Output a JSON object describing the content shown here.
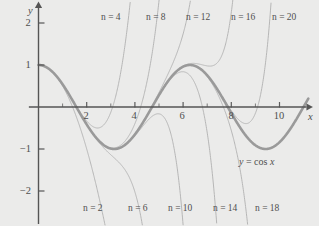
{
  "figure": {
    "caption": "Taylor polynomials of cos x at 0",
    "background_color": "#ebebea",
    "axis_color": "#555555",
    "cos_curve_color": "#9a9a9a",
    "taylor_curve_color": "#b3b3b3"
  },
  "axes": {
    "x_axis_name": "x",
    "y_axis_name": "y",
    "x_ticks_labeled": [
      "2",
      "4",
      "6",
      "8",
      "10"
    ],
    "y_ticks_labeled": [
      "2",
      "1",
      "−1",
      "−2"
    ]
  },
  "curve_label": {
    "text": "y = cos x",
    "lhs": "y",
    "eq": "=",
    "rhs": "cos x"
  },
  "series_labels_top": [
    {
      "text": "n = 4"
    },
    {
      "text": "n = 8"
    },
    {
      "text": "n = 12"
    },
    {
      "text": "n = 16"
    },
    {
      "text": "n = 20"
    }
  ],
  "series_labels_bottom": [
    {
      "text": "n = 2"
    },
    {
      "text": "n = 6"
    },
    {
      "text": "n = 10"
    },
    {
      "text": "n = 14"
    },
    {
      "text": "n = 18"
    }
  ],
  "chart_data": {
    "type": "line",
    "xlabel": "x",
    "ylabel": "y",
    "xlim": [
      -0.4,
      11.2
    ],
    "ylim": [
      -2.5,
      2.5
    ],
    "x_ticks": [
      1,
      2,
      3,
      4,
      5,
      6,
      7,
      8,
      9,
      10
    ],
    "x_tick_labels": [
      "",
      "2",
      "",
      "4",
      "",
      "6",
      "",
      "8",
      "",
      "10"
    ],
    "y_ticks": [
      -2,
      -1,
      1,
      2
    ],
    "y_tick_labels": [
      "−2",
      "−1",
      "1",
      "2"
    ],
    "grid": false,
    "legend": "inline-annotations",
    "series": [
      {
        "name": "y = cos x",
        "degree": null,
        "color": "#9a9a9a",
        "width": 2.6,
        "formula": "cos(x)",
        "annotation": {
          "text": "y = cos x",
          "x": 9.6,
          "y": -1.28
        }
      },
      {
        "name": "n = 2",
        "degree": 2,
        "color": "#b3b3b3",
        "width": 1,
        "formula": "1 - x^2/2!",
        "annotation_position": "bottom"
      },
      {
        "name": "n = 4",
        "degree": 4,
        "color": "#b3b3b3",
        "width": 1,
        "formula": "1 - x^2/2! + x^4/4!",
        "annotation_position": "top"
      },
      {
        "name": "n = 6",
        "degree": 6,
        "color": "#b3b3b3",
        "width": 1,
        "formula": "1 - x^2/2! + x^4/4! - x^6/6!",
        "annotation_position": "bottom"
      },
      {
        "name": "n = 8",
        "degree": 8,
        "color": "#b3b3b3",
        "width": 1,
        "formula": "sum_{k=0}^{4} (-1)^k x^{2k}/(2k)!",
        "annotation_position": "top"
      },
      {
        "name": "n = 10",
        "degree": 10,
        "color": "#b3b3b3",
        "width": 1,
        "formula": "sum_{k=0}^{5} (-1)^k x^{2k}/(2k)!",
        "annotation_position": "bottom"
      },
      {
        "name": "n = 12",
        "degree": 12,
        "color": "#b3b3b3",
        "width": 1,
        "formula": "sum_{k=0}^{6} (-1)^k x^{2k}/(2k)!",
        "annotation_position": "top"
      },
      {
        "name": "n = 14",
        "degree": 14,
        "color": "#b3b3b3",
        "width": 1,
        "formula": "sum_{k=0}^{7} (-1)^k x^{2k}/(2k)!",
        "annotation_position": "bottom"
      },
      {
        "name": "n = 16",
        "degree": 16,
        "color": "#b3b3b3",
        "width": 1,
        "formula": "sum_{k=0}^{8} (-1)^k x^{2k}/(2k)!",
        "annotation_position": "top"
      },
      {
        "name": "n = 18",
        "degree": 18,
        "color": "#b3b3b3",
        "width": 1,
        "formula": "sum_{k=0}^{9} (-1)^k x^{2k}/(2k)!",
        "annotation_position": "bottom"
      },
      {
        "name": "n = 20",
        "degree": 20,
        "color": "#b3b3b3",
        "width": 1,
        "formula": "sum_{k=0}^{10} (-1)^k x^{2k}/(2k)!",
        "annotation_position": "top"
      }
    ]
  },
  "geometry": {
    "origin_px": [
      38.5,
      107
    ],
    "x_unit_px": 24.1,
    "y_unit_px": 42
  }
}
